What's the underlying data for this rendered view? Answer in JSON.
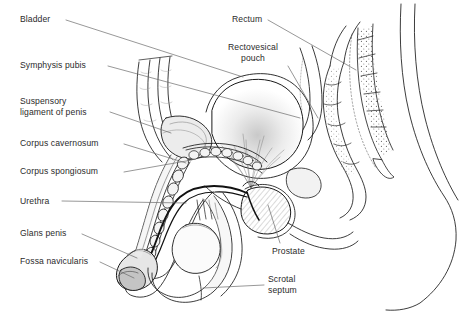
{
  "figure": {
    "background_color": "#ffffff",
    "line_color": "#1a1a1a",
    "leader_color": "#6b6b6b",
    "text_color": "#2b2b2b",
    "shade_light": "#ededed",
    "shade_mid": "#d8d8d8",
    "shade_dark": "#bcbcbc"
  },
  "labels": {
    "left": [
      {
        "id": "bladder",
        "text": "Bladder",
        "x": 20,
        "y": 14
      },
      {
        "id": "symphysis-pubis",
        "text": "Symphysis pubis",
        "x": 20,
        "y": 60
      },
      {
        "id": "suspensory-ligament",
        "text": "Suspensory\nligament of penis",
        "x": 20,
        "y": 96
      },
      {
        "id": "corpus-cavernosum",
        "text": "Corpus cavernosum",
        "x": 20,
        "y": 138
      },
      {
        "id": "corpus-spongiosum",
        "text": "Corpus spongiosum",
        "x": 20,
        "y": 166
      },
      {
        "id": "urethra",
        "text": "Urethra",
        "x": 20,
        "y": 196
      },
      {
        "id": "glans-penis",
        "text": "Glans penis",
        "x": 20,
        "y": 228
      },
      {
        "id": "fossa-navicularis",
        "text": "Fossa navicularis",
        "x": 20,
        "y": 256
      }
    ],
    "right": [
      {
        "id": "rectum",
        "text": "Rectum",
        "x": 232,
        "y": 14
      },
      {
        "id": "rectovesical-pouch",
        "text": "Rectovesical\npouch",
        "x": 228,
        "y": 42
      },
      {
        "id": "prostate",
        "text": "Prostate",
        "x": 272,
        "y": 246
      },
      {
        "id": "scrotal-septum",
        "text": "Scrotal\nseptum",
        "x": 268,
        "y": 274
      }
    ]
  }
}
